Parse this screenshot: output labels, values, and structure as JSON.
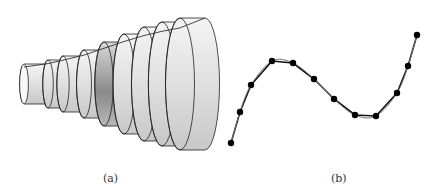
{
  "figure": {
    "panel_a": {
      "caption": "(a)",
      "description": "solid of revolution approximated by stacked cylindrical disks",
      "disks": [
        {
          "x1": 24,
          "x2": 48,
          "ry": 20
        },
        {
          "x1": 48,
          "x2": 63,
          "ry": 24
        },
        {
          "x1": 63,
          "x2": 84,
          "ry": 28
        },
        {
          "x1": 84,
          "x2": 104,
          "ry": 34
        },
        {
          "x1": 104,
          "x2": 124,
          "ry": 42
        },
        {
          "x1": 124,
          "x2": 144,
          "ry": 50
        },
        {
          "x1": 144,
          "x2": 162,
          "ry": 57
        },
        {
          "x1": 162,
          "x2": 180,
          "ry": 62
        },
        {
          "x1": 180,
          "x2": 205,
          "ry": 66
        }
      ],
      "center_y": 84
    },
    "panel_b": {
      "caption": "(b)",
      "description": "smooth curve approximated by polygonal path through points",
      "points": [
        [
          231,
          143
        ],
        [
          240,
          112
        ],
        [
          251,
          85
        ],
        [
          272,
          61
        ],
        [
          293,
          63
        ],
        [
          314,
          79
        ],
        [
          334,
          99
        ],
        [
          355,
          115
        ],
        [
          376,
          116
        ],
        [
          397,
          93
        ],
        [
          408,
          66
        ],
        [
          417,
          35
        ]
      ]
    }
  }
}
